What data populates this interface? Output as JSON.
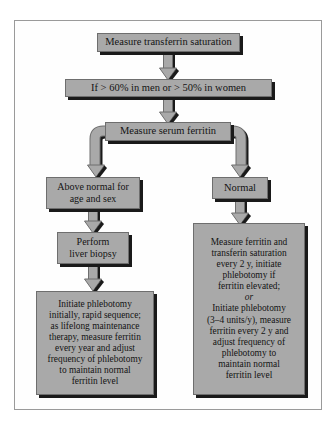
{
  "figure": {
    "type": "clinical-algorithm-flowchart",
    "fill_color": "#a9a9a9",
    "stroke_color": "#6e6e6e",
    "shadow_color": "#1a1a1a",
    "background_color": "#ffffff"
  },
  "nodes": {
    "transferrin_saturation": {
      "id": "n1",
      "label": "Measure transferrin saturation"
    },
    "threshold": {
      "id": "n2",
      "label": "If > 60% in men or > 50% in women"
    },
    "serum_ferritin": {
      "id": "n3",
      "label": "Measure serum ferritin"
    },
    "above_normal": {
      "id": "n4",
      "label": "Above normal for\nage and sex"
    },
    "normal": {
      "id": "n5",
      "label": "Normal"
    },
    "liver_biopsy": {
      "id": "n6",
      "label": "Perform\nliver biopsy"
    },
    "phlebotomy_plan": {
      "id": "n7",
      "label": "Initiate phlebotomy\ninitially, rapid sequence;\nas lifelong maintenance\ntherapy, measure ferritin\nevery year and adjust\nfrequency of phlebotomy\nto maintain normal\nferritin level"
    },
    "monitor_plan": {
      "id": "n8",
      "part1": "Measure ferritin and\ntransferin saturation\nevery 2 y, initiate\nphlebotomy if\nferritin elevated;",
      "or_label": "or",
      "part2": "Initiate phlebotomy\n(3–4 units/y), measure\nferritin every 2 y and\nadjust frequency of\nphlebotomy to\nmaintain normal\nferritin level"
    }
  },
  "edges": [
    {
      "from": "transferrin_saturation",
      "to": "threshold",
      "kind": "arrow-down"
    },
    {
      "from": "threshold",
      "to": "serum_ferritin",
      "kind": "arrow-down"
    },
    {
      "from": "serum_ferritin",
      "to": "above_normal",
      "kind": "branch-left"
    },
    {
      "from": "serum_ferritin",
      "to": "normal",
      "kind": "branch-right"
    },
    {
      "from": "above_normal",
      "to": "liver_biopsy",
      "kind": "arrow-down"
    },
    {
      "from": "liver_biopsy",
      "to": "phlebotomy_plan",
      "kind": "arrow-down"
    },
    {
      "from": "normal",
      "to": "monitor_plan",
      "kind": "arrow-down"
    }
  ]
}
